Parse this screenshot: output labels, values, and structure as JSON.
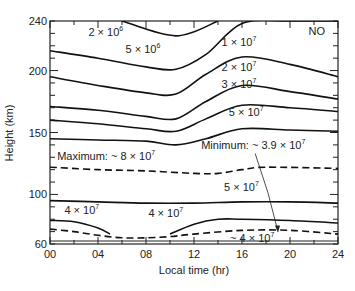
{
  "chart_data": {
    "type": "line",
    "title": "",
    "xlabel": "Local time (hr)",
    "ylabel": "Height (km)",
    "xlim": [
      0,
      24
    ],
    "ylim": [
      60,
      240
    ],
    "x_ticks": [
      "00",
      "04",
      "08",
      "12",
      "16",
      "20",
      "24"
    ],
    "y_ticks": [
      "60",
      "100",
      "150",
      "200",
      "240"
    ],
    "grid": false,
    "legend": null,
    "corner_label": "NO",
    "contours": [
      {
        "name": "2 × 10^6",
        "style": "solid",
        "x": [
          6,
          10.5,
          14
        ],
        "y": [
          240,
          228,
          240
        ]
      },
      {
        "name": "5 × 10^6",
        "style": "solid",
        "x": [
          0,
          4,
          8,
          10.5,
          13,
          16,
          20,
          24
        ],
        "y": [
          216,
          210,
          203,
          201,
          213,
          238,
          240,
          240
        ]
      },
      {
        "name": "1 × 10^7",
        "style": "solid",
        "x": [
          0,
          4,
          8,
          10.5,
          13,
          16,
          20,
          24
        ],
        "y": [
          195,
          188,
          182,
          181,
          197,
          211,
          205,
          195
        ]
      },
      {
        "name": "2 × 10^7",
        "style": "solid",
        "x": [
          0,
          4,
          8,
          10.5,
          13,
          16,
          20,
          24
        ],
        "y": [
          171,
          168,
          163,
          161,
          175,
          188,
          183,
          177
        ]
      },
      {
        "name": "3 × 10^7",
        "style": "solid",
        "x": [
          0,
          4,
          8,
          10.5,
          13,
          16,
          20,
          24
        ],
        "y": [
          160,
          157,
          153,
          151,
          161,
          172,
          170,
          167
        ]
      },
      {
        "name": "5 × 10^7",
        "style": "solid",
        "x": [
          0,
          4,
          8,
          10.5,
          13,
          16,
          20,
          24
        ],
        "y": [
          145,
          144,
          143,
          140,
          145,
          153,
          152,
          151
        ]
      },
      {
        "name": "Maximum: ~ 8 × 10^7",
        "style": "dashed",
        "x": [
          0,
          4,
          8,
          12,
          14,
          16,
          18,
          24
        ],
        "y": [
          122,
          120,
          119,
          117,
          117,
          120,
          122,
          121
        ]
      },
      {
        "name": "5 × 10^7 (lower)",
        "style": "solid",
        "x": [
          0,
          4,
          8,
          12,
          16,
          20,
          24
        ],
        "y": [
          95,
          94,
          93,
          93,
          94,
          94,
          93
        ]
      },
      {
        "name": "4 × 10^7 (left)",
        "style": "solid",
        "x": [
          0,
          2,
          4,
          5
        ],
        "y": [
          79,
          78,
          73,
          68
        ]
      },
      {
        "name": "4 × 10^7 (right)",
        "style": "solid",
        "x": [
          10,
          12,
          14,
          16,
          20,
          24
        ],
        "y": [
          68,
          76,
          80,
          80,
          79,
          77
        ]
      },
      {
        "name": "Minimum: ~ 3.9 × 10^7",
        "style": "dashed",
        "x": [
          0,
          2,
          4,
          6,
          8,
          10,
          12,
          16,
          20,
          24
        ],
        "y": [
          72,
          70,
          67,
          65,
          65,
          66,
          68,
          71,
          71,
          68
        ]
      }
    ],
    "annotations": [
      {
        "text": "2 × 10",
        "exp": "6",
        "x": 3.2,
        "y": 228
      },
      {
        "text": "5 × 10",
        "exp": "6",
        "x": 6.3,
        "y": 214
      },
      {
        "text": "1 × 10",
        "exp": "7",
        "x": 14.3,
        "y": 220
      },
      {
        "text": "2 × 10",
        "exp": "7",
        "x": 14.3,
        "y": 200
      },
      {
        "text": "3 × 10",
        "exp": "7",
        "x": 14.3,
        "y": 186
      },
      {
        "text": "5 × 10",
        "exp": "7",
        "x": 14.9,
        "y": 163
      },
      {
        "text": "Maximum: ~ 8 × 10",
        "exp": "7",
        "x": 0.6,
        "y": 128
      },
      {
        "text": "Minimum: ~ 3.9 × 10",
        "exp": "7",
        "x": 12.6,
        "y": 137
      },
      {
        "text": "5 × 10",
        "exp": "7",
        "x": 14.5,
        "y": 103
      },
      {
        "text": "4 × 10",
        "exp": "7",
        "x": 1.2,
        "y": 84
      },
      {
        "text": "4 × 10",
        "exp": "7",
        "x": 8.2,
        "y": 82
      },
      {
        "text": "~ 4 × 10",
        "exp": "7",
        "x": 15,
        "y": 61.5
      }
    ],
    "arrow": {
      "from": [
        17.1,
        133
      ],
      "to": [
        19,
        70
      ]
    }
  }
}
